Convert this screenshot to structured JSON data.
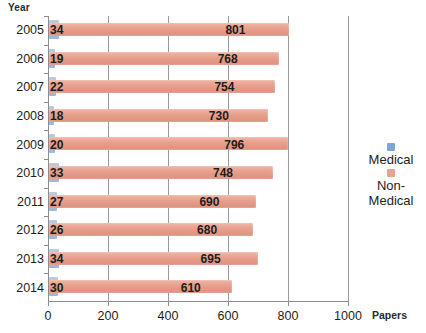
{
  "chart_data": {
    "type": "bar",
    "orientation": "horizontal",
    "title": "",
    "xlabel": "Papers",
    "ylabel": "Year",
    "categories": [
      "2005",
      "2006",
      "2007",
      "2008",
      "2009",
      "2010",
      "2011",
      "2012",
      "2013",
      "2014"
    ],
    "series": [
      {
        "name": "Medical",
        "color": "#7ea6d4",
        "values": [
          34,
          19,
          22,
          18,
          20,
          33,
          27,
          26,
          34,
          30
        ]
      },
      {
        "name": "Non-Medical",
        "color": "#e9a28f",
        "values": [
          801,
          768,
          754,
          730,
          796,
          748,
          690,
          680,
          695,
          610
        ]
      }
    ],
    "xlim": [
      0,
      1000
    ],
    "xticks": [
      "0",
      "200",
      "400",
      "600",
      "800",
      "1000"
    ],
    "xtick_values": [
      0,
      200,
      400,
      600,
      800,
      1000
    ],
    "grid": true,
    "data_labels": true,
    "legend_position": "right"
  },
  "axes": {
    "y_title": "Year",
    "x_title": "Papers"
  },
  "legend": {
    "items": [
      {
        "label": "Medical",
        "color": "#7ea6d4",
        "swatch_name": "legend-swatch-medical"
      },
      {
        "label": "Non-Medical",
        "color": "#e9a28f",
        "swatch_name": "legend-swatch-nonmedical"
      }
    ]
  }
}
